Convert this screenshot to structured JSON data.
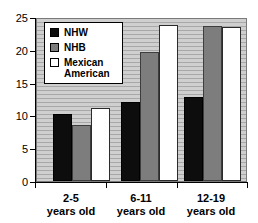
{
  "chart_data": {
    "type": "bar",
    "title": "",
    "subtitle": "",
    "xlabel": "",
    "ylabel": "",
    "ylim": [
      0,
      25
    ],
    "yticks": [
      0,
      5,
      10,
      15,
      20,
      25
    ],
    "grid": true,
    "grid_orientation": "horizontal",
    "legend_position": "top-left",
    "categories": [
      "2-5 years old",
      "6-11 years old",
      "12-19 years old"
    ],
    "category_lines": [
      {
        "line1": "2-5",
        "line2": "years old"
      },
      {
        "line1": "6-11",
        "line2": "years old"
      },
      {
        "line1": "12-19",
        "line2": "years old"
      }
    ],
    "series": [
      {
        "name": "NHW",
        "color": "#0d0d0d",
        "values": [
          10.2,
          12.0,
          12.8
        ]
      },
      {
        "name": "NHB",
        "color": "#7d7d7d",
        "values": [
          8.5,
          19.7,
          23.6
        ]
      },
      {
        "name": "Mexican American",
        "color": "#ffffff",
        "values": [
          11.2,
          23.8,
          23.5
        ]
      }
    ]
  },
  "legend": {
    "items": [
      {
        "label": "NHW",
        "swatch": "black-swatch"
      },
      {
        "label": "NHB",
        "swatch": "gray-swatch"
      },
      {
        "label": "Mexican American",
        "swatch": "white-swatch",
        "line1": "Mexican",
        "line2": "American"
      }
    ]
  },
  "axis": {
    "y_tick_labels": [
      "25",
      "20",
      "15",
      "10",
      "5",
      "0"
    ]
  }
}
